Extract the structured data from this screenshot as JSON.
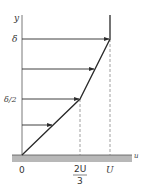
{
  "diagram": {
    "title": "",
    "axes": {
      "y_label": "y",
      "x_label": "u"
    },
    "y_ticks": {
      "delta": "δ",
      "half_delta": "δ/2"
    },
    "x_ticks": {
      "origin": "0",
      "two_thirds_U_num": "2U",
      "two_thirds_U_den": "3",
      "U": "U"
    },
    "colors": {
      "line": "#2a2a2a",
      "axis": "#555555",
      "ground": "#b8b8b8",
      "dashed": "#777777"
    }
  }
}
